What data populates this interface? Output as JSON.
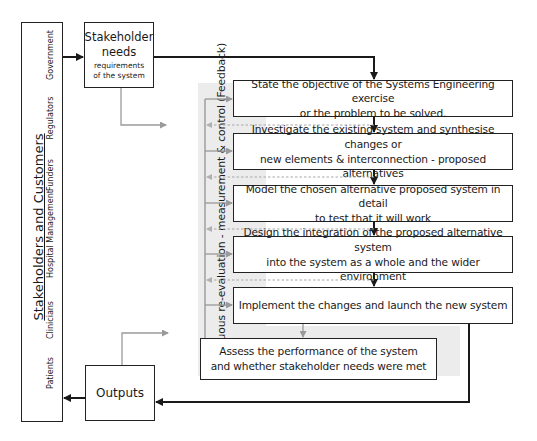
{
  "stakeholders": {
    "title": "Stakeholders and Customers",
    "groups": [
      "Government",
      "Regulators",
      "Funders",
      "Hospital Management",
      "Clinicians",
      "Patients"
    ]
  },
  "needs_box": {
    "title_line1": "Stakeholder",
    "title_line2": "needs",
    "sub_line1": "requirements",
    "sub_line2": "of the system"
  },
  "outputs_box": {
    "label": "Outputs"
  },
  "feedback_label": "Continuous re-evaluation - measurement & control (Feedback)",
  "steps": [
    {
      "line1": "State the objective of the Systems Engineering exercise",
      "line2": "or the problem to be solved."
    },
    {
      "line1": "Investigate the existing system and synthesise changes or",
      "line2": "new elements & interconnection -  proposed alternatives"
    },
    {
      "line1": "Model the chosen alternative proposed system in detail",
      "line2": "to test that it will work"
    },
    {
      "line1": "Design the integration of the proposed alternative system",
      "line2": "into the system as a whole and the wider environment"
    },
    {
      "line1": "Implement the changes and launch the new system",
      "line2": ""
    },
    {
      "line1": "Assess the performance of the system",
      "line2": "and whether stakeholder needs were met"
    }
  ],
  "colors": {
    "flow_line": "#1a1a1a",
    "feedback_line": "#9a9a9a",
    "panel_bg": "#ececec"
  }
}
